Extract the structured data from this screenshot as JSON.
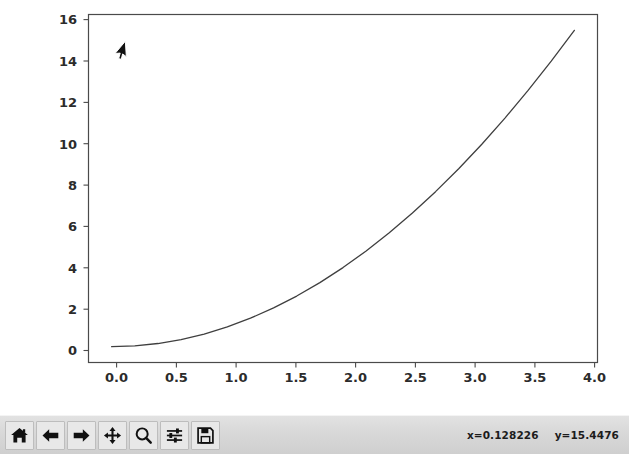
{
  "window": {
    "type": "matplotlib-figure-window",
    "background_color": "#ffffff"
  },
  "chart_data": {
    "type": "line",
    "title": "",
    "xlabel": "",
    "ylabel": "",
    "xlim": [
      -0.2,
      4.2
    ],
    "ylim": [
      -0.8,
      16.8
    ],
    "grid": false,
    "legend": null,
    "line_color": "#3f3f3f",
    "line_width": 1.3,
    "xticks": [
      "0.0",
      "0.5",
      "1.0",
      "1.5",
      "2.0",
      "2.5",
      "3.0",
      "3.5",
      "4.0"
    ],
    "xtick_values": [
      0.0,
      0.5,
      1.0,
      1.5,
      2.0,
      2.5,
      3.0,
      3.5,
      4.0
    ],
    "yticks": [
      "0",
      "2",
      "4",
      "6",
      "8",
      "10",
      "12",
      "14",
      "16"
    ],
    "ytick_values": [
      0,
      2,
      4,
      6,
      8,
      10,
      12,
      14,
      16
    ],
    "series": [
      {
        "name": "y = x^2",
        "x": [
          0.0,
          0.2,
          0.4,
          0.6,
          0.8,
          1.0,
          1.2,
          1.4,
          1.6,
          1.8,
          2.0,
          2.2,
          2.4,
          2.6,
          2.8,
          3.0,
          3.2,
          3.4,
          3.6,
          3.8,
          4.0
        ],
        "values": [
          0.0,
          0.04,
          0.16,
          0.36,
          0.64,
          1.0,
          1.44,
          1.96,
          2.56,
          3.24,
          4.0,
          4.84,
          5.76,
          6.76,
          7.84,
          9.0,
          10.24,
          11.56,
          12.96,
          14.44,
          16.0
        ]
      }
    ]
  },
  "cursor": {
    "icon": "mouse-pointer-arrow",
    "x_px": 118,
    "y_px": 50
  },
  "toolbar": {
    "background_color": "#d6d6d6",
    "buttons": [
      {
        "name": "home-button",
        "icon": "home-icon",
        "tooltip": "Reset original view"
      },
      {
        "name": "back-button",
        "icon": "arrow-left-icon",
        "tooltip": "Back to previous view"
      },
      {
        "name": "forward-button",
        "icon": "arrow-right-icon",
        "tooltip": "Forward to next view"
      },
      {
        "name": "pan-button",
        "icon": "move-arrows-icon",
        "tooltip": "Pan axes with left mouse, zoom with right"
      },
      {
        "name": "zoom-button",
        "icon": "magnifier-icon",
        "tooltip": "Zoom to rectangle"
      },
      {
        "name": "subplots-button",
        "icon": "sliders-icon",
        "tooltip": "Configure subplots"
      },
      {
        "name": "save-button",
        "icon": "floppy-disk-icon",
        "tooltip": "Save the figure"
      }
    ],
    "coordinates": {
      "x": "x=0.128226",
      "y": "y=15.4476"
    }
  }
}
